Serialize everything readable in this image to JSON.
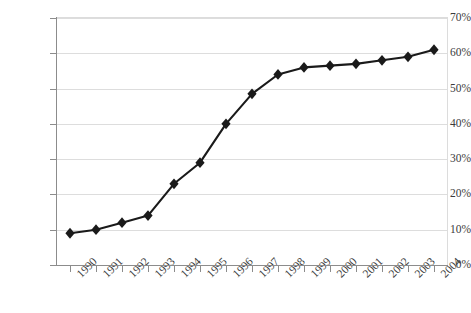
{
  "chart_data": {
    "type": "line",
    "title": "",
    "subtitle": "",
    "xlabel": "",
    "ylabel": "",
    "categories": [
      "1990",
      "1991",
      "1992",
      "1993",
      "1994",
      "1995",
      "1996",
      "1997",
      "1998",
      "1999",
      "2000",
      "2001",
      "2002",
      "2003",
      "2004"
    ],
    "values": [
      9,
      10,
      12,
      14,
      23,
      29,
      40,
      48.5,
      54,
      56,
      56.5,
      57,
      58,
      59,
      61
    ],
    "series": [
      {
        "name": "",
        "values": [
          9,
          10,
          12,
          14,
          23,
          29,
          40,
          48.5,
          54,
          56,
          56.5,
          57,
          58,
          59,
          61
        ]
      }
    ],
    "ylim": [
      0,
      70
    ],
    "ytick_step": 10,
    "ytick_labels": [
      "0%",
      "10%",
      "20%",
      "30%",
      "40%",
      "50%",
      "60%",
      "70%"
    ],
    "ytick_values": [
      0,
      10,
      20,
      30,
      40,
      50,
      60,
      70
    ],
    "value_suffix": "%",
    "grid": true,
    "grid_axis": "y",
    "legend": false,
    "legend_position": "none",
    "marker": "diamond",
    "annotations": []
  },
  "style": {
    "line_color": "#1a1a1a",
    "marker_color": "#1a1a1a",
    "grid_color": "#dddddd",
    "axis_color": "#8c8c8c",
    "frame_color": "#dcdcdc",
    "label_color": "#3b3b3b",
    "background": "#ffffff"
  }
}
